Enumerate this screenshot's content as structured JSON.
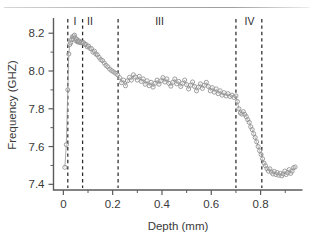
{
  "chart_data": {
    "type": "scatter",
    "title": "",
    "xlabel": "Depth (mm)",
    "ylabel": "Frequency (GHZ)",
    "xlim": [
      -0.04,
      0.97
    ],
    "ylim": [
      7.37,
      8.27
    ],
    "xticks": [
      0,
      0.2,
      0.4,
      0.6,
      0.8
    ],
    "xticklabels": [
      "0",
      "0.2",
      "0.4",
      "0.6",
      "0.8"
    ],
    "yticks": [
      7.4,
      7.6,
      7.8,
      8.0,
      8.2
    ],
    "yticklabels": [
      "7.4",
      "7.6",
      "7.8",
      "8.0",
      "8.2"
    ],
    "xminorticks": [
      0.1,
      0.3,
      0.5,
      0.7,
      0.9
    ],
    "yminorticks": [
      7.5,
      7.7,
      7.9,
      8.1
    ],
    "grid": false,
    "legend": null,
    "marker": "open-circle",
    "connected": true,
    "annotations": [
      {
        "label": "I",
        "x": 0.047,
        "y": 8.245
      },
      {
        "label": "II",
        "x": 0.108,
        "y": 8.245
      },
      {
        "label": "III",
        "x": 0.39,
        "y": 8.245
      },
      {
        "label": "IV",
        "x": 0.755,
        "y": 8.245
      }
    ],
    "vlines": [
      0.018,
      0.078,
      0.222,
      0.7,
      0.805
    ],
    "x": [
      0.006,
      0.012,
      0.018,
      0.022,
      0.026,
      0.03,
      0.033,
      0.036,
      0.039,
      0.042,
      0.045,
      0.048,
      0.051,
      0.054,
      0.057,
      0.06,
      0.063,
      0.066,
      0.07,
      0.074,
      0.078,
      0.082,
      0.087,
      0.092,
      0.097,
      0.102,
      0.108,
      0.114,
      0.12,
      0.126,
      0.132,
      0.138,
      0.145,
      0.152,
      0.159,
      0.166,
      0.173,
      0.18,
      0.188,
      0.196,
      0.204,
      0.212,
      0.22,
      0.228,
      0.236,
      0.244,
      0.252,
      0.26,
      0.268,
      0.276,
      0.284,
      0.292,
      0.3,
      0.308,
      0.316,
      0.324,
      0.332,
      0.34,
      0.348,
      0.356,
      0.364,
      0.372,
      0.38,
      0.388,
      0.396,
      0.404,
      0.412,
      0.42,
      0.428,
      0.436,
      0.444,
      0.452,
      0.46,
      0.468,
      0.476,
      0.484,
      0.492,
      0.5,
      0.508,
      0.516,
      0.524,
      0.532,
      0.54,
      0.548,
      0.556,
      0.564,
      0.572,
      0.58,
      0.588,
      0.596,
      0.604,
      0.612,
      0.62,
      0.628,
      0.636,
      0.644,
      0.652,
      0.66,
      0.668,
      0.676,
      0.684,
      0.692,
      0.7,
      0.706,
      0.712,
      0.718,
      0.724,
      0.73,
      0.736,
      0.742,
      0.748,
      0.754,
      0.76,
      0.766,
      0.772,
      0.778,
      0.784,
      0.79,
      0.796,
      0.802,
      0.808,
      0.814,
      0.82,
      0.826,
      0.832,
      0.838,
      0.844,
      0.85,
      0.856,
      0.862,
      0.868,
      0.874,
      0.88,
      0.886,
      0.892,
      0.898,
      0.904,
      0.91,
      0.916,
      0.922,
      0.928,
      0.934,
      0.94
    ],
    "y": [
      7.49,
      7.61,
      7.9,
      8.09,
      8.14,
      8.15,
      8.165,
      8.18,
      8.17,
      8.185,
      8.19,
      8.175,
      8.16,
      8.168,
      8.155,
      8.16,
      8.152,
      8.158,
      8.15,
      8.152,
      8.148,
      8.15,
      8.142,
      8.14,
      8.128,
      8.132,
      8.12,
      8.118,
      8.1,
      8.105,
      8.09,
      8.085,
      8.072,
      8.06,
      8.055,
      8.042,
      8.03,
      8.022,
      8.01,
      8.002,
      7.995,
      7.988,
      7.98,
      7.965,
      7.938,
      7.952,
      7.922,
      7.948,
      7.966,
      7.952,
      7.98,
      7.968,
      7.952,
      7.972,
      7.945,
      7.958,
      7.93,
      7.948,
      7.922,
      7.94,
      7.915,
      7.935,
      7.952,
      7.93,
      7.948,
      7.965,
      7.942,
      7.958,
      7.935,
      7.92,
      7.94,
      7.958,
      7.932,
      7.945,
      7.918,
      7.935,
      7.952,
      7.928,
      7.905,
      7.925,
      7.942,
      7.918,
      7.895,
      7.915,
      7.932,
      7.908,
      7.925,
      7.94,
      7.918,
      7.895,
      7.912,
      7.888,
      7.905,
      7.88,
      7.895,
      7.872,
      7.885,
      7.868,
      7.88,
      7.865,
      7.872,
      7.86,
      7.868,
      7.838,
      7.8,
      7.778,
      7.772,
      7.785,
      7.77,
      7.758,
      7.742,
      7.728,
      7.705,
      7.69,
      7.668,
      7.648,
      7.625,
      7.6,
      7.578,
      7.558,
      7.535,
      7.512,
      7.498,
      7.482,
      7.47,
      7.482,
      7.465,
      7.455,
      7.468,
      7.452,
      7.462,
      7.448,
      7.458,
      7.445,
      7.455,
      7.47,
      7.452,
      7.462,
      7.478,
      7.458,
      7.47,
      7.488,
      7.492
    ]
  },
  "colors": {
    "axis": "#5b5b5b",
    "marker_stroke": "#8d8d8d",
    "line": "#9a9a9a",
    "divider": "#2b2b2b",
    "text": "#3a3a3a"
  }
}
